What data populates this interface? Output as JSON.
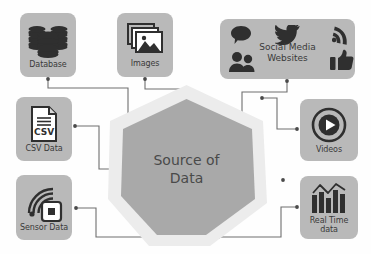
{
  "diagram": {
    "title": "Source of Data",
    "center": {
      "label": "Source of\nData",
      "shape": "heptagon",
      "fill_color": "#a9a9a9",
      "ring_color": "#ececec"
    },
    "colors": {
      "node_background": "#b9b9b9",
      "node_text": "#3a3a3a",
      "icon_color": "#2f2f2f",
      "connector": "#6e6e6e",
      "page_background": "#ffffff"
    },
    "nodes": [
      {
        "id": "database",
        "label": "Database",
        "icon": "database-stack-icon",
        "position": "top-left"
      },
      {
        "id": "images",
        "label": "Images",
        "icon": "images-photo-stack-icon",
        "position": "top-center"
      },
      {
        "id": "social",
        "label": "Social Media\nWebsites",
        "icon": "social-media-icons",
        "position": "top-right",
        "sub_icons": [
          "speech-bubble-icon",
          "twitter-bird-icon",
          "rss-feed-icon",
          "people-group-icon",
          "thumbs-up-icon"
        ]
      },
      {
        "id": "csv",
        "label": "CSV Data",
        "icon": "csv-file-icon",
        "icon_text": "CSV",
        "position": "left-middle"
      },
      {
        "id": "sensor",
        "label": "Sensor Data",
        "icon": "sensor-signal-chip-icon",
        "position": "left-bottom"
      },
      {
        "id": "videos",
        "label": "Videos",
        "icon": "play-button-circle-icon",
        "position": "right-middle"
      },
      {
        "id": "realtime",
        "label": "Real Time\ndata",
        "icon": "bar-chart-trend-icon",
        "position": "right-bottom"
      }
    ],
    "connectors": [
      {
        "from": "database",
        "to": "center"
      },
      {
        "from": "images",
        "to": "center"
      },
      {
        "from": "social",
        "to": "center"
      },
      {
        "from": "csv",
        "to": "center"
      },
      {
        "from": "sensor",
        "to": "center"
      },
      {
        "from": "videos",
        "to": "center"
      },
      {
        "from": "realtime",
        "to": "center"
      }
    ]
  }
}
